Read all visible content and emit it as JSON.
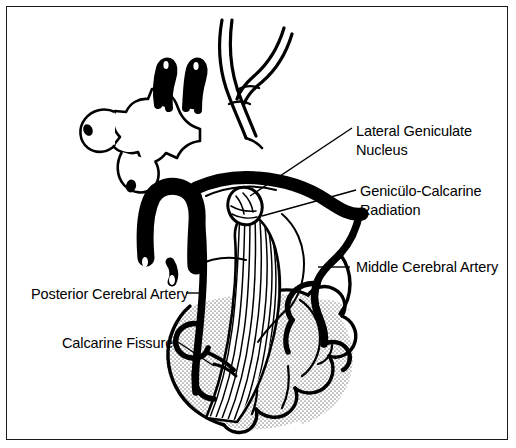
{
  "figure": {
    "background_color": "#ffffff",
    "ink_color": "#000000",
    "border_color": "#1a1a1a",
    "stipple_color": "#9a9a9a"
  },
  "labels": {
    "lateral_geniculate_nucleus": {
      "line1": "Lateral Geniculate",
      "line2": "Nucleus"
    },
    "geniculo_calcarine_radiation": {
      "line1": "Genicülo-Calcarine",
      "line2": "Radiation"
    },
    "middle_cerebral_artery": {
      "line1": "Middle Cerebral Artery"
    },
    "posterior_cerebral_artery": {
      "line1": "Posterior Cerebral Artery"
    },
    "calcarine_fissure": {
      "line1": "Calcarine Fissure"
    }
  },
  "structures": [
    {
      "name": "anterior-cerebral-arteries",
      "description": "paired vertical vessel horns at top of chiasm region"
    },
    {
      "name": "optic-chiasm",
      "description": "star-shaped central structure at left"
    },
    {
      "name": "basilar-artery",
      "description": "inverted U shaped thick vessel below chiasm"
    },
    {
      "name": "internal-carotid-artery",
      "description": "Y-shaped bifurcating vessel at top"
    },
    {
      "name": "lateral-geniculate-nucleus",
      "description": "oval nucleus with internal hatching"
    },
    {
      "name": "geniculo-calcarine-radiation",
      "description": "striated fiber band descending to occipital lobe"
    },
    {
      "name": "middle-cerebral-artery",
      "description": "thick vessel descending along right side"
    },
    {
      "name": "posterior-cerebral-artery",
      "description": "thick vessel descending along left side"
    },
    {
      "name": "occipital-lobe",
      "description": "gyri and sulci with stippled shading at bottom"
    },
    {
      "name": "calcarine-fissure",
      "description": "fissure at lower left of occipital lobe"
    }
  ]
}
